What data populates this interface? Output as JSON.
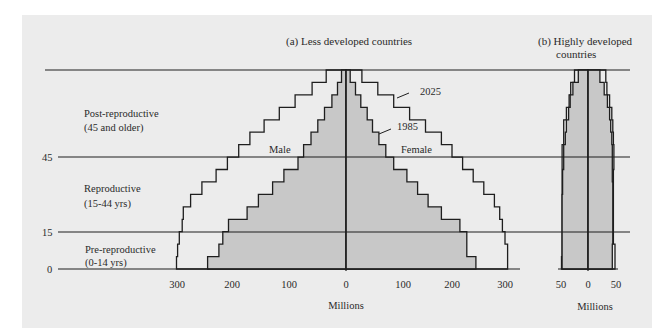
{
  "panel_a": {
    "title": "(a)  Less developed countries",
    "xlabel": "Millions",
    "xticks_left": [
      "300",
      "200",
      "100",
      "0"
    ],
    "xticks_right": [
      "100",
      "200",
      "300"
    ],
    "label_male": "Male",
    "label_female": "Female",
    "label_2025": "2025",
    "label_1985": "1985"
  },
  "panel_b": {
    "title_line1": "(b)  Highly developed",
    "title_line2": "countries",
    "xlabel": "Millions",
    "xticks": [
      "50",
      "0",
      "50"
    ]
  },
  "age_groups": {
    "post_line1": "Post-reproductive",
    "post_line2": "(45 and older)",
    "repro_line1": "Reproductive",
    "repro_line2": "(15-44 yrs)",
    "pre_line1": "Pre-reproductive",
    "pre_line2": "(0-14 yrs)"
  },
  "yticks": [
    "45",
    "15",
    "0"
  ],
  "colors": {
    "panel_bg": "#ececec",
    "fill_1985": "#c8c8c8",
    "line": "#1e1e1e"
  },
  "chart_data": [
    {
      "type": "bar",
      "subtype": "population-pyramid",
      "title": "(a) Less developed countries",
      "xlabel": "Millions",
      "ylabel": "Age",
      "age_bands": [
        "0-4",
        "5-9",
        "10-14",
        "15-19",
        "20-24",
        "25-29",
        "30-34",
        "35-39",
        "40-44",
        "45-49",
        "50-54",
        "55-59",
        "60-64",
        "65-69",
        "70-74",
        "75+"
      ],
      "yticks": [
        0,
        15,
        45
      ],
      "xlim": [
        -300,
        300
      ],
      "series": [
        {
          "name": "1985 Male",
          "values": [
            245,
            225,
            218,
            208,
            175,
            155,
            130,
            110,
            85,
            75,
            62,
            50,
            38,
            25,
            15,
            8
          ]
        },
        {
          "name": "1985 Female",
          "values": [
            245,
            228,
            228,
            215,
            180,
            155,
            135,
            115,
            90,
            75,
            62,
            50,
            40,
            28,
            18,
            8
          ]
        },
        {
          "name": "2025 Male",
          "values": [
            300,
            298,
            295,
            290,
            288,
            275,
            255,
            230,
            210,
            190,
            170,
            145,
            118,
            90,
            60,
            35
          ]
        },
        {
          "name": "2025 Female",
          "values": [
            305,
            305,
            300,
            295,
            290,
            280,
            260,
            240,
            220,
            200,
            180,
            150,
            120,
            90,
            60,
            30
          ]
        }
      ],
      "annotations": [
        "Male",
        "Female",
        "1985",
        "2025",
        "Pre-reproductive (0-14 yrs)",
        "Reproductive (15-44 yrs)",
        "Post-reproductive (45 and older)"
      ]
    },
    {
      "type": "bar",
      "subtype": "population-pyramid",
      "title": "(b) Highly developed countries",
      "xlabel": "Millions",
      "ylabel": "Age",
      "age_bands": [
        "0-4",
        "5-9",
        "10-14",
        "15-19",
        "20-24",
        "25-29",
        "30-34",
        "35-39",
        "40-44",
        "45-49",
        "50-54",
        "55-59",
        "60-64",
        "65-69",
        "70-74",
        "75+"
      ],
      "xlim": [
        -50,
        50
      ],
      "series": [
        {
          "name": "1985 Male",
          "values": [
            48,
            48,
            48,
            48,
            48,
            48,
            47,
            47,
            45,
            45,
            42,
            40,
            36,
            33,
            28,
            18
          ]
        },
        {
          "name": "1985 Female",
          "values": [
            45,
            45,
            46,
            46,
            46,
            46,
            46,
            45,
            45,
            45,
            44,
            42,
            40,
            36,
            30,
            22
          ]
        },
        {
          "name": "2025 Male",
          "values": [
            49,
            48,
            48,
            48,
            48,
            48,
            48,
            48,
            48,
            48,
            45,
            45,
            40,
            35,
            32,
            25
          ]
        },
        {
          "name": "2025 Female",
          "values": [
            50,
            50,
            47,
            47,
            47,
            47,
            47,
            47,
            48,
            48,
            47,
            46,
            44,
            40,
            35,
            33
          ]
        }
      ]
    }
  ]
}
